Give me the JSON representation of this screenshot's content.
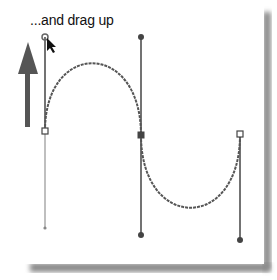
{
  "caption": "...and drag up",
  "colors": {
    "background": "#ffffff",
    "path": "#555555",
    "handle_line": "#444444",
    "handle_line_light": "#aaaaaa",
    "arrow": "#555555",
    "shadow": "#8a8a8a"
  },
  "path": {
    "anchors": [
      {
        "name": "start-anchor",
        "x": 45,
        "y": 131,
        "style": "hollow"
      },
      {
        "name": "middle-anchor",
        "x": 141,
        "y": 135,
        "style": "filled"
      },
      {
        "name": "end-anchor",
        "x": 240,
        "y": 135,
        "style": "hollow"
      }
    ],
    "handles": [
      {
        "from": "start-anchor",
        "to": {
          "x": 45,
          "y": 37
        },
        "style": "dark",
        "cursor": true
      },
      {
        "from": "start-anchor",
        "to": {
          "x": 45,
          "y": 228
        },
        "style": "light"
      },
      {
        "from": "middle-anchor",
        "to": {
          "x": 141,
          "y": 37
        },
        "style": "dark"
      },
      {
        "from": "middle-anchor",
        "to": {
          "x": 141,
          "y": 235
        },
        "style": "dark"
      },
      {
        "from": "end-anchor",
        "to": {
          "x": 240,
          "y": 240
        },
        "style": "dark"
      }
    ],
    "upper_curve_peak": {
      "x": 92,
      "y": 61
    },
    "lower_curve_trough": {
      "x": 190,
      "y": 213
    }
  },
  "drag_arrow": {
    "direction": "up",
    "tip": {
      "x": 28,
      "y": 42
    },
    "tail": {
      "x": 28,
      "y": 127
    }
  }
}
